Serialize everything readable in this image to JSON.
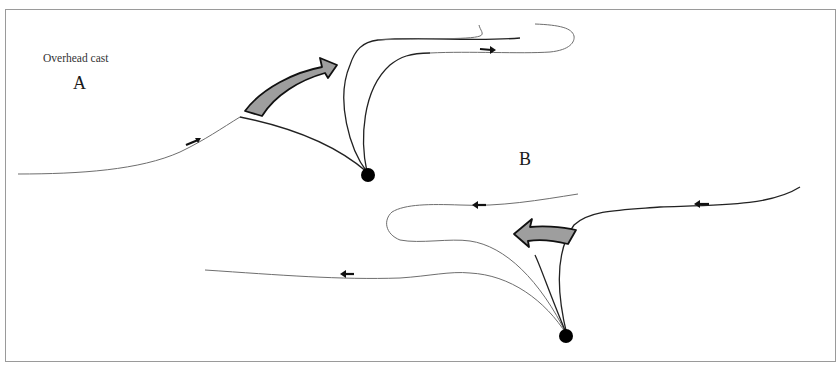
{
  "figure": {
    "title": "Overhead cast",
    "panels": [
      {
        "id": "A",
        "label": "A",
        "direction": "forward (right)"
      },
      {
        "id": "B",
        "label": "B",
        "direction": "backward (left)"
      }
    ]
  },
  "colors": {
    "line_fine": "#6e6e6e",
    "line_rod": "#222222",
    "big_arrow_fill": "#9e9e9e",
    "big_arrow_stroke": "#111111",
    "frame": "#9a9a9a",
    "caster_dot": "#000000"
  }
}
